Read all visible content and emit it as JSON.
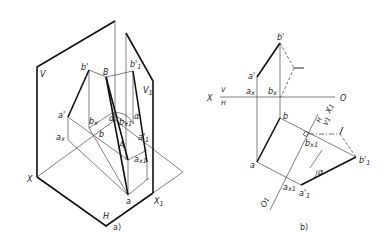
{
  "figure_a": {
    "caption": "a)",
    "labels": {
      "V": "V",
      "H": "H",
      "X": "X",
      "X1": "X",
      "X1_sub": "1",
      "V1": "V",
      "V1_sub": "1",
      "B": "B",
      "A": "A",
      "b_prime": "b'",
      "b1_prime": "b'",
      "b1_prime_sub": "1",
      "a_prime": "a'",
      "a1_prime": "a'",
      "a1_prime_sub": "1",
      "bx": "b",
      "bx_sub": "x",
      "bx1": "b",
      "bx1_sub": "x1",
      "ax": "a",
      "ax_sub": "x",
      "ax1": "a",
      "ax1_sub": "x1",
      "b": "b",
      "a": "a",
      "alpha": "α"
    }
  },
  "figure_b": {
    "caption": "b)",
    "labels": {
      "X": "X",
      "V": "V",
      "H": "H",
      "O": "O",
      "b_prime": "b'",
      "a_prime": "a'",
      "ax": "a",
      "ax_sub": "x",
      "bx": "b",
      "bx_sub": "x",
      "b": "b",
      "a": "a",
      "H_new": "H",
      "V1": "V",
      "V1_sub": "1",
      "X1": "X",
      "X1_sub": "1",
      "bx1": "b",
      "bx1_sub": "x1",
      "ax1": "a",
      "ax1_sub": "x1",
      "b1_prime": "b'",
      "b1_prime_sub": "1",
      "a1_prime": "a'",
      "a1_prime_sub": "1",
      "O1": "O",
      "O1_sub": "1",
      "alpha": "α"
    }
  }
}
